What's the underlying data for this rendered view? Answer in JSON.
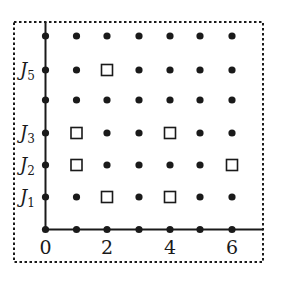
{
  "diagram": {
    "type": "lattice-grid",
    "x_ticks": [
      {
        "value": 0,
        "label": "0"
      },
      {
        "value": 2,
        "label": "2"
      },
      {
        "value": 4,
        "label": "4"
      },
      {
        "value": 6,
        "label": "6"
      }
    ],
    "y_labels": [
      {
        "level": 1,
        "label": "J",
        "sub": "1"
      },
      {
        "level": 2,
        "label": "J",
        "sub": "2"
      },
      {
        "level": 3,
        "label": "J",
        "sub": "3"
      },
      {
        "level": 5,
        "label": "J",
        "sub": "5"
      }
    ],
    "x_range": [
      0,
      6
    ],
    "y_range": [
      0,
      6
    ],
    "squares": [
      [
        2,
        5
      ],
      [
        1,
        3
      ],
      [
        4,
        3
      ],
      [
        1,
        2
      ],
      [
        6,
        2
      ],
      [
        2,
        1
      ],
      [
        4,
        1
      ]
    ],
    "colors": {
      "ink": "#1a1a1a",
      "background": "#ffffff"
    },
    "border": "dashed"
  }
}
